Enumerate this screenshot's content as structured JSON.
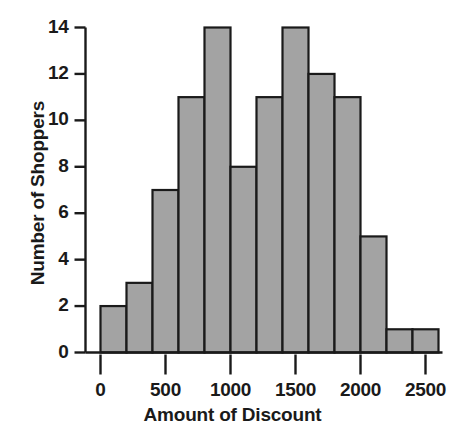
{
  "chart_data": {
    "type": "bar",
    "title": "",
    "xlabel": "Amount of Discount",
    "ylabel": "Number of Shoppers",
    "bin_width": 200,
    "categories": [
      "0-200",
      "200-400",
      "400-600",
      "600-800",
      "800-1000",
      "1000-1200",
      "1200-1400",
      "1400-1600",
      "1600-1800",
      "1800-2000",
      "2000-2200",
      "2200-2400",
      "2400-2600"
    ],
    "bin_edges": [
      0,
      200,
      400,
      600,
      800,
      1000,
      1200,
      1400,
      1600,
      1800,
      2000,
      2200,
      2400,
      2600
    ],
    "values": [
      2,
      3,
      7,
      11,
      14,
      8,
      11,
      14,
      12,
      11,
      5,
      1,
      1
    ],
    "xlim": [
      0,
      2600
    ],
    "ylim": [
      0,
      14
    ],
    "xticks": [
      0,
      500,
      1000,
      1500,
      2000,
      2500
    ],
    "xtick_labels": [
      "0",
      "500",
      "1000",
      "1500",
      "2000",
      "2500"
    ],
    "yticks": [
      0,
      2,
      4,
      6,
      8,
      10,
      12,
      14
    ],
    "ytick_labels": [
      "0",
      "2",
      "4",
      "6",
      "8",
      "10",
      "12",
      "14"
    ],
    "grid": false,
    "legend": null,
    "bar_fill_color": "#a3a3a3",
    "bar_edge_color": "#1a1a1a",
    "axis_color": "#1a1a1a"
  }
}
